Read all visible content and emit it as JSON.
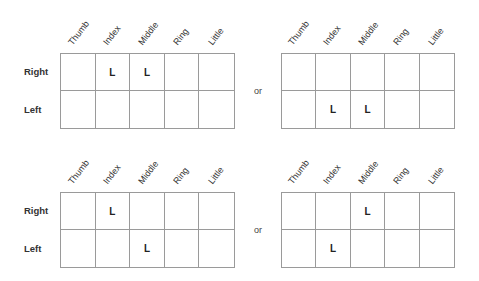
{
  "columns": [
    "Thumb",
    "Index",
    "Middle",
    "Ring",
    "Little"
  ],
  "rows": [
    "Right",
    "Left"
  ],
  "separator": "or",
  "panels": [
    {
      "id": "top-left",
      "show_row_labels": true,
      "cells": [
        [
          "",
          "L",
          "L",
          "",
          ""
        ],
        [
          "",
          "",
          "",
          "",
          ""
        ]
      ]
    },
    {
      "id": "top-right",
      "show_row_labels": false,
      "cells": [
        [
          "",
          "",
          "",
          "",
          ""
        ],
        [
          "",
          "L",
          "L",
          "",
          ""
        ]
      ]
    },
    {
      "id": "bottom-left",
      "show_row_labels": true,
      "cells": [
        [
          "",
          "L",
          "",
          "",
          ""
        ],
        [
          "",
          "",
          "L",
          "",
          ""
        ]
      ]
    },
    {
      "id": "bottom-right",
      "show_row_labels": false,
      "cells": [
        [
          "",
          "",
          "L",
          "",
          ""
        ],
        [
          "",
          "L",
          "",
          "",
          ""
        ]
      ]
    }
  ]
}
